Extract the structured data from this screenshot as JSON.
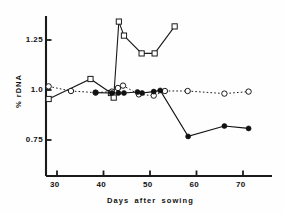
{
  "chart_data": {
    "type": "line",
    "title": "",
    "xlabel": "Days after sowing",
    "ylabel": "% rDNA",
    "xlim": [
      27,
      73
    ],
    "ylim": [
      0.66,
      1.38
    ],
    "xticks": [
      30,
      40,
      50,
      60,
      70
    ],
    "xtick_labels": [
      "30",
      "40",
      "50",
      "60",
      "70"
    ],
    "yticks": [
      0.75,
      1.0,
      1.25
    ],
    "ytick_labels": [
      "0.75",
      "1.0",
      "1.25"
    ],
    "grid": false,
    "legend": "none",
    "series": [
      {
        "name": "open-square-series",
        "marker": "open-square",
        "linestyle": "solid",
        "color": "#1a1a1a",
        "points": [
          {
            "x": 28.2,
            "y": 0.955
          },
          {
            "x": 37.2,
            "y": 1.055
          },
          {
            "x": 41.6,
            "y": 0.985
          },
          {
            "x": 42.2,
            "y": 0.962
          },
          {
            "x": 43.3,
            "y": 1.342
          },
          {
            "x": 44.4,
            "y": 1.272
          },
          {
            "x": 48.2,
            "y": 1.183
          },
          {
            "x": 51.0,
            "y": 1.183
          },
          {
            "x": 55.3,
            "y": 1.318
          }
        ]
      },
      {
        "name": "open-circle-series",
        "marker": "open-circle",
        "linestyle": "dotted",
        "color": "#1a1a1a",
        "points": [
          {
            "x": 28.2,
            "y": 1.018
          },
          {
            "x": 33.0,
            "y": 0.995
          },
          {
            "x": 38.3,
            "y": 0.987
          },
          {
            "x": 41.8,
            "y": 0.992
          },
          {
            "x": 43.1,
            "y": 1.01
          },
          {
            "x": 44.2,
            "y": 1.022
          },
          {
            "x": 47.6,
            "y": 0.978
          },
          {
            "x": 50.8,
            "y": 0.972
          },
          {
            "x": 53.2,
            "y": 0.995
          },
          {
            "x": 58.1,
            "y": 0.995
          },
          {
            "x": 66.0,
            "y": 0.982
          },
          {
            "x": 71.2,
            "y": 0.992
          }
        ]
      },
      {
        "name": "filled-circle-series",
        "marker": "filled-circle",
        "linestyle": "solid",
        "color": "#111111",
        "points": [
          {
            "x": 38.3,
            "y": 0.987
          },
          {
            "x": 41.8,
            "y": 0.985
          },
          {
            "x": 43.2,
            "y": 0.985
          },
          {
            "x": 44.4,
            "y": 0.985
          },
          {
            "x": 47.3,
            "y": 0.99
          },
          {
            "x": 48.3,
            "y": 0.985
          },
          {
            "x": 50.8,
            "y": 0.992
          },
          {
            "x": 52.2,
            "y": 0.998
          },
          {
            "x": 58.2,
            "y": 0.768
          },
          {
            "x": 66.0,
            "y": 0.82
          },
          {
            "x": 71.2,
            "y": 0.808
          }
        ]
      }
    ]
  },
  "axes": {
    "xlabel": "Days after sowing",
    "ylabel": "% rDNA"
  }
}
